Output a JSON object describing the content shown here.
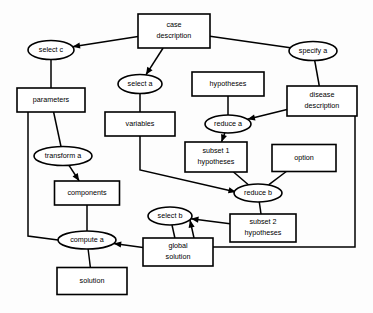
{
  "diagram": {
    "background_color": "#fdfdfd",
    "line_color": "#000000",
    "node_fill": "#ffffff",
    "nodes": [
      {
        "id": "case_description",
        "shape": "box",
        "label_line1": "case",
        "label_line2": "description",
        "cx": 174,
        "cy": 31,
        "w": 72,
        "h": 34
      },
      {
        "id": "select_c",
        "shape": "ellipse",
        "label_line1": "select c",
        "label_line2": "",
        "cx": 51,
        "cy": 50,
        "w": 46,
        "h": 19
      },
      {
        "id": "specify_a",
        "shape": "ellipse",
        "label_line1": "specify a",
        "label_line2": "",
        "cx": 313,
        "cy": 51,
        "w": 48,
        "h": 19
      },
      {
        "id": "select_a",
        "shape": "ellipse",
        "label_line1": "select a",
        "label_line2": "",
        "cx": 140,
        "cy": 84,
        "w": 44,
        "h": 19
      },
      {
        "id": "parameters",
        "shape": "box",
        "label_line1": "parameters",
        "label_line2": "",
        "cx": 51,
        "cy": 100,
        "w": 68,
        "h": 24
      },
      {
        "id": "hypotheses",
        "shape": "box",
        "label_line1": "hypotheses",
        "label_line2": "",
        "cx": 228,
        "cy": 84,
        "w": 72,
        "h": 24
      },
      {
        "id": "disease_description",
        "shape": "box",
        "label_line1": "disease",
        "label_line2": "description",
        "cx": 322,
        "cy": 101,
        "w": 70,
        "h": 30
      },
      {
        "id": "variables",
        "shape": "box",
        "label_line1": "variables",
        "label_line2": "",
        "cx": 140,
        "cy": 124,
        "w": 70,
        "h": 24
      },
      {
        "id": "reduce_a",
        "shape": "ellipse",
        "label_line1": "reduce a",
        "label_line2": "",
        "cx": 228,
        "cy": 124,
        "w": 46,
        "h": 18
      },
      {
        "id": "transform_a",
        "shape": "ellipse",
        "label_line1": "transform a",
        "label_line2": "",
        "cx": 63,
        "cy": 156,
        "w": 58,
        "h": 19
      },
      {
        "id": "subset_1",
        "shape": "box",
        "label_line1": "subset 1",
        "label_line2": "hypotheses",
        "cx": 216,
        "cy": 157,
        "w": 62,
        "h": 30
      },
      {
        "id": "option",
        "shape": "box",
        "label_line1": "option",
        "label_line2": "",
        "cx": 304,
        "cy": 158,
        "w": 64,
        "h": 27
      },
      {
        "id": "components",
        "shape": "box",
        "label_line1": "components",
        "label_line2": "",
        "cx": 87,
        "cy": 193,
        "w": 65,
        "h": 24
      },
      {
        "id": "reduce_b",
        "shape": "ellipse",
        "label_line1": "reduce b",
        "label_line2": "",
        "cx": 258,
        "cy": 193,
        "w": 48,
        "h": 18
      },
      {
        "id": "select_b",
        "shape": "ellipse",
        "label_line1": "select b",
        "label_line2": "",
        "cx": 170,
        "cy": 216,
        "w": 44,
        "h": 18
      },
      {
        "id": "subset_2",
        "shape": "box",
        "label_line1": "subset 2",
        "label_line2": "hypotheses",
        "cx": 263,
        "cy": 228,
        "w": 66,
        "h": 28
      },
      {
        "id": "compute_a",
        "shape": "ellipse",
        "label_line1": "compute a",
        "label_line2": "",
        "cx": 87,
        "cy": 240,
        "w": 58,
        "h": 18
      },
      {
        "id": "global_solution",
        "shape": "box",
        "label_line1": "global",
        "label_line2": "solution",
        "cx": 178,
        "cy": 252,
        "w": 70,
        "h": 28
      },
      {
        "id": "solution",
        "shape": "box",
        "label_line1": "solution",
        "label_line2": "",
        "cx": 92,
        "cy": 281,
        "w": 70,
        "h": 27
      }
    ],
    "edges": [
      {
        "from": "case_description",
        "to": "select_c",
        "arrow": true
      },
      {
        "from": "case_description",
        "to": "specify_a",
        "arrow": false
      },
      {
        "from": "case_description",
        "to": "select_a",
        "arrow": true
      },
      {
        "from": "select_c",
        "to": "parameters",
        "arrow": false
      },
      {
        "from": "specify_a",
        "to": "disease_description",
        "arrow": false
      },
      {
        "from": "select_a",
        "to": "variables",
        "arrow": false
      },
      {
        "from": "hypotheses",
        "to": "reduce_a",
        "arrow": false
      },
      {
        "from": "disease_description",
        "to": "reduce_a",
        "arrow": true
      },
      {
        "from": "reduce_a",
        "to": "subset_1",
        "arrow": true
      },
      {
        "from": "parameters",
        "to": "transform_a",
        "arrow": false
      },
      {
        "from": "parameters",
        "to": "compute_a",
        "arrow": false
      },
      {
        "from": "transform_a",
        "to": "components",
        "arrow": true
      },
      {
        "from": "variables",
        "to": "reduce_b",
        "arrow": true
      },
      {
        "from": "subset_1",
        "to": "reduce_b",
        "arrow": false
      },
      {
        "from": "option",
        "to": "reduce_b",
        "arrow": false
      },
      {
        "from": "components",
        "to": "compute_a",
        "arrow": false
      },
      {
        "from": "reduce_b",
        "to": "subset_2",
        "arrow": false
      },
      {
        "from": "subset_2",
        "to": "select_b",
        "arrow": true
      },
      {
        "from": "disease_description",
        "to": "select_b",
        "arrow": true
      },
      {
        "from": "select_b",
        "to": "global_solution",
        "arrow": false
      },
      {
        "from": "global_solution",
        "to": "compute_a",
        "arrow": true
      },
      {
        "from": "compute_a",
        "to": "solution",
        "arrow": false
      }
    ]
  }
}
